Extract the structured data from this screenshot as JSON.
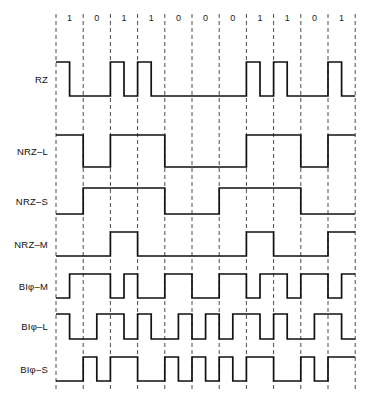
{
  "figure": {
    "background_color": "#ffffff",
    "line_color": "#111111",
    "grid_color": "#4a4a4a"
  },
  "bit_sequence": {
    "label": "data bits",
    "bits": [
      "1",
      "0",
      "1",
      "1",
      "0",
      "0",
      "0",
      "1",
      "1",
      "0",
      "1"
    ],
    "count": 11
  },
  "geometry": {
    "x_start": 56,
    "bit_width": 27.2,
    "grid_top": 14,
    "grid_bottom": 392,
    "label_x": 48,
    "bit_label_y": 21
  },
  "rows": [
    {
      "name": "RZ",
      "label": "RZ",
      "baseline_y": 96,
      "high_y": 62,
      "levels": [
        1,
        0,
        1,
        1,
        0,
        0,
        0,
        1,
        1,
        0,
        1
      ],
      "half_bit": true
    },
    {
      "name": "NRZ-L",
      "label": "NRZ–L",
      "baseline_y": 167,
      "high_y": 135,
      "levels": [
        1,
        0,
        1,
        1,
        0,
        0,
        0,
        1,
        1,
        0,
        1
      ],
      "half_bit": false
    },
    {
      "name": "NRZ-S",
      "label": "NRZ–S",
      "baseline_y": 214,
      "high_y": 188,
      "levels": [
        0,
        1,
        1,
        1,
        0,
        0,
        1,
        1,
        1,
        0,
        0
      ],
      "half_bit": false
    },
    {
      "name": "NRZ-M",
      "label": "NRZ–M",
      "baseline_y": 256,
      "high_y": 232,
      "levels": [
        0,
        0,
        1,
        0,
        0,
        0,
        0,
        1,
        0,
        0,
        1
      ],
      "half_bit": false
    },
    {
      "name": "Biphase-M",
      "label": "BIφ–M",
      "baseline_y": 298,
      "high_y": 274,
      "pairs": [
        [
          0,
          1
        ],
        [
          1,
          1
        ],
        [
          0,
          1
        ],
        [
          0,
          0
        ],
        [
          1,
          1
        ],
        [
          0,
          0
        ],
        [
          1,
          1
        ],
        [
          0,
          1
        ],
        [
          1,
          0
        ],
        [
          1,
          1
        ],
        [
          0,
          1
        ]
      ],
      "half_bit": true
    },
    {
      "name": "Biphase-L",
      "label": "BIφ–L",
      "baseline_y": 339,
      "high_y": 314,
      "pairs": [
        [
          1,
          0
        ],
        [
          0,
          1
        ],
        [
          1,
          0
        ],
        [
          1,
          0
        ],
        [
          0,
          1
        ],
        [
          0,
          1
        ],
        [
          0,
          1
        ],
        [
          1,
          0
        ],
        [
          1,
          0
        ],
        [
          0,
          1
        ],
        [
          1,
          0
        ]
      ],
      "half_bit": true
    },
    {
      "name": "Biphase-S",
      "label": "BIφ–S",
      "baseline_y": 381,
      "high_y": 357,
      "pairs": [
        [
          0,
          0
        ],
        [
          1,
          0
        ],
        [
          1,
          1
        ],
        [
          0,
          0
        ],
        [
          1,
          0
        ],
        [
          1,
          0
        ],
        [
          1,
          0
        ],
        [
          1,
          1
        ],
        [
          0,
          0
        ],
        [
          1,
          0
        ],
        [
          1,
          1
        ]
      ],
      "half_bit": true
    }
  ],
  "chart_data": {
    "type": "line",
    "xlabel": "",
    "ylabel": "",
    "categories": [
      "1",
      "0",
      "1",
      "1",
      "0",
      "0",
      "0",
      "1",
      "1",
      "0",
      "1"
    ],
    "series": [
      {
        "name": "RZ",
        "values": [
          1,
          0,
          1,
          1,
          0,
          0,
          0,
          1,
          1,
          0,
          1
        ]
      },
      {
        "name": "NRZ-L",
        "values": [
          1,
          0,
          1,
          1,
          0,
          0,
          0,
          1,
          1,
          0,
          1
        ]
      },
      {
        "name": "NRZ-S",
        "values": [
          0,
          1,
          1,
          1,
          0,
          0,
          1,
          1,
          1,
          0,
          0
        ]
      },
      {
        "name": "NRZ-M",
        "values": [
          0,
          0,
          1,
          0,
          0,
          0,
          0,
          1,
          0,
          0,
          1
        ]
      },
      {
        "name": "Biφ-M",
        "values": [
          0.5,
          1,
          0.5,
          0,
          1,
          0,
          1,
          0.5,
          0.5,
          1,
          0.5
        ]
      },
      {
        "name": "Biφ-L",
        "values": [
          0.5,
          0.5,
          0.5,
          0.5,
          0.5,
          0.5,
          0.5,
          0.5,
          0.5,
          0.5,
          0.5
        ]
      },
      {
        "name": "Biφ-S",
        "values": [
          0,
          0.5,
          1,
          0,
          0.5,
          0.5,
          0.5,
          1,
          0,
          0.5,
          1
        ]
      }
    ],
    "legend_position": "left",
    "grid": true,
    "ylim": [
      0,
      1
    ]
  }
}
